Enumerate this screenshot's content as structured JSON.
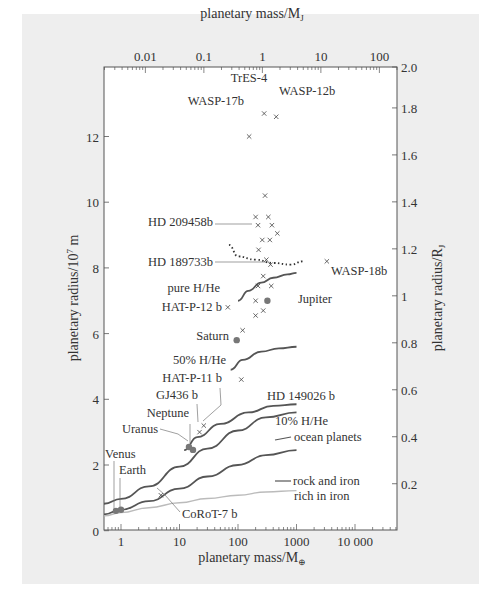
{
  "chart_data": {
    "type": "scatter",
    "title": "",
    "xlabel": "planetary mass/M⊕",
    "x2label": "planetary mass/MJ",
    "ylabel": "planetary radius/10^7 m",
    "y2label": "planetary radius/RJ",
    "xscale": "log",
    "xlim": [
      0.51,
      60000
    ],
    "ylim": [
      0,
      14.1
    ],
    "x_ticks": [
      "1",
      "10",
      "100",
      "1000",
      "10 000"
    ],
    "x_tick_values": [
      1,
      10,
      100,
      1000,
      10000
    ],
    "x2_ticks": [
      "0.01",
      "0.1",
      "1",
      "10",
      "100"
    ],
    "x2_tick_values": [
      0.01,
      0.1,
      1,
      10,
      100
    ],
    "y_ticks": [
      "0",
      "2",
      "4",
      "6",
      "8",
      "10",
      "12"
    ],
    "y_tick_values": [
      0,
      2,
      4,
      6,
      8,
      10,
      12
    ],
    "y2_ticks": [
      "0.2",
      "0.4",
      "0.6",
      "0.8",
      "1",
      "1.2",
      "1.4",
      "1.6",
      "1.8",
      "2.0"
    ],
    "y2_tick_values": [
      0.2,
      0.4,
      0.6,
      0.8,
      1.0,
      1.2,
      1.4,
      1.6,
      1.8,
      2.0
    ],
    "grid": false,
    "labeled_points": [
      {
        "name": "TrES-4",
        "mass_earth": 280,
        "radius_1e7m": 12.7,
        "marker": "x"
      },
      {
        "name": "WASP-12b",
        "mass_earth": 450,
        "radius_1e7m": 12.6,
        "marker": "x"
      },
      {
        "name": "WASP-17b",
        "mass_earth": 155,
        "radius_1e7m": 12.0,
        "marker": "x"
      },
      {
        "name": "HD 209458b",
        "mass_earth": 220,
        "radius_1e7m": 9.3,
        "marker": "x"
      },
      {
        "name": "HD 189733b",
        "mass_earth": 360,
        "radius_1e7m": 8.1,
        "marker": "x"
      },
      {
        "name": "WASP-18b",
        "mass_earth": 3300,
        "radius_1e7m": 8.2,
        "marker": "x"
      },
      {
        "name": "HAT-P-12 b",
        "mass_earth": 67,
        "radius_1e7m": 6.8,
        "marker": "x"
      },
      {
        "name": "Jupiter",
        "mass_earth": 318,
        "radius_1e7m": 7.0,
        "marker": "dot"
      },
      {
        "name": "Saturn",
        "mass_earth": 95,
        "radius_1e7m": 5.8,
        "marker": "dot"
      },
      {
        "name": "HD 149026 b",
        "mass_earth": 114,
        "radius_1e7m": 4.6,
        "marker": "x"
      },
      {
        "name": "HAT-P-11 b",
        "mass_earth": 26,
        "radius_1e7m": 3.2,
        "marker": "x"
      },
      {
        "name": "GJ436 b",
        "mass_earth": 22,
        "radius_1e7m": 3.0,
        "marker": "x"
      },
      {
        "name": "Neptune",
        "mass_earth": 17,
        "radius_1e7m": 2.46,
        "marker": "dot"
      },
      {
        "name": "Uranus",
        "mass_earth": 14.5,
        "radius_1e7m": 2.55,
        "marker": "dot"
      },
      {
        "name": "Venus",
        "mass_earth": 0.82,
        "radius_1e7m": 0.605,
        "marker": "dot"
      },
      {
        "name": "Earth",
        "mass_earth": 1.0,
        "radius_1e7m": 0.637,
        "marker": "dot"
      },
      {
        "name": "CoRoT-7 b",
        "mass_earth": 4.8,
        "radius_1e7m": 1.08,
        "marker": "x"
      }
    ],
    "unlabeled_points": [
      {
        "mass_earth": 290,
        "radius_1e7m": 10.2
      },
      {
        "mass_earth": 200,
        "radius_1e7m": 9.55
      },
      {
        "mass_earth": 330,
        "radius_1e7m": 9.55
      },
      {
        "mass_earth": 380,
        "radius_1e7m": 9.3
      },
      {
        "mass_earth": 470,
        "radius_1e7m": 9.05
      },
      {
        "mass_earth": 260,
        "radius_1e7m": 8.85
      },
      {
        "mass_earth": 350,
        "radius_1e7m": 8.85
      },
      {
        "mass_earth": 225,
        "radius_1e7m": 8.55
      },
      {
        "mass_earth": 305,
        "radius_1e7m": 8.25
      },
      {
        "mass_earth": 270,
        "radius_1e7m": 7.75
      },
      {
        "mass_earth": 220,
        "radius_1e7m": 7.45
      },
      {
        "mass_earth": 370,
        "radius_1e7m": 7.45
      },
      {
        "mass_earth": 200,
        "radius_1e7m": 7.0
      },
      {
        "mass_earth": 270,
        "radius_1e7m": 6.7
      },
      {
        "mass_earth": 200,
        "radius_1e7m": 6.55
      },
      {
        "mass_earth": 120,
        "radius_1e7m": 6.1
      }
    ],
    "series": [
      {
        "name": "pure H/He",
        "style": "solid-dark",
        "x": [
          100,
          150,
          250,
          400,
          700,
          1000
        ],
        "y": [
          7.0,
          7.3,
          7.55,
          7.7,
          7.8,
          7.85
        ]
      },
      {
        "name": "irradiated (dotted)",
        "style": "dotted",
        "x": [
          70,
          100,
          200,
          400,
          800,
          1300
        ],
        "y": [
          8.7,
          8.35,
          8.25,
          8.15,
          8.1,
          8.2
        ]
      },
      {
        "name": "50% H/He",
        "style": "solid-dark",
        "x": [
          75,
          120,
          250,
          500,
          1000
        ],
        "y": [
          4.9,
          5.2,
          5.45,
          5.55,
          5.6
        ]
      },
      {
        "name": "10% H/He",
        "style": "solid-dark",
        "x": [
          12,
          20,
          50,
          150,
          400,
          1000
        ],
        "y": [
          2.45,
          2.85,
          3.25,
          3.6,
          3.8,
          3.85
        ]
      },
      {
        "name": "ocean planets",
        "style": "solid-dark",
        "x": [
          0.5,
          1,
          3,
          10,
          30,
          100,
          300,
          1000
        ],
        "y": [
          0.82,
          0.97,
          1.35,
          1.95,
          2.5,
          3.05,
          3.45,
          3.6
        ]
      },
      {
        "name": "rock and iron",
        "style": "solid-dark",
        "x": [
          0.5,
          1,
          3,
          10,
          30,
          100,
          300,
          1000
        ],
        "y": [
          0.5,
          0.64,
          0.9,
          1.28,
          1.65,
          2.0,
          2.3,
          2.45
        ]
      },
      {
        "name": "rich in iron",
        "style": "solid-light",
        "x": [
          0.5,
          1,
          3,
          10,
          30,
          100,
          300,
          1000
        ],
        "y": [
          0.45,
          0.55,
          0.7,
          0.85,
          0.98,
          1.08,
          1.18,
          1.22
        ]
      }
    ]
  },
  "labels": {
    "top_axis": "planetary mass/M",
    "top_axis_sub": "J",
    "bottom_axis": "planetary mass/M",
    "bottom_axis_sub": "⊕",
    "left_axis": "planetary radius/10",
    "left_axis_sup": "7",
    "left_axis_tail": " m",
    "right_axis": "planetary radius/R",
    "right_axis_sub": "J",
    "curve_pure": "pure H/He",
    "curve_50": "50% H/He",
    "curve_10": "10% H/He",
    "curve_ocean": "ocean planets",
    "curve_rock": "rock and iron",
    "curve_iron": "rich in iron"
  }
}
